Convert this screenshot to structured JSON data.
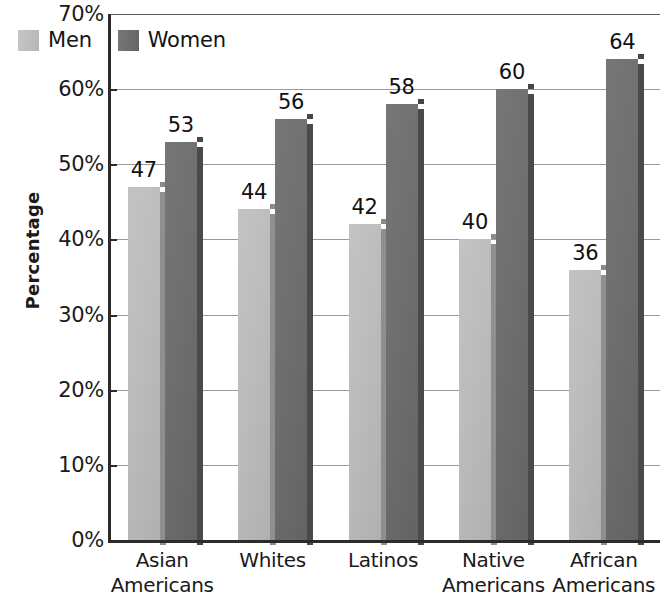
{
  "chart_data": {
    "type": "bar",
    "title": "",
    "subtitle": "",
    "xlabel": "",
    "ylabel": "Percentage",
    "categories": [
      "Asian\nAmericans",
      "Whites",
      "Latinos",
      "Native\nAmericans",
      "African\nAmericans"
    ],
    "series": [
      {
        "name": "Men",
        "values": [
          47,
          44,
          42,
          40,
          36
        ],
        "color": "#b8b8b8"
      },
      {
        "name": "Women",
        "values": [
          53,
          56,
          58,
          60,
          64
        ],
        "color": "#6b6b6b"
      }
    ],
    "ylim": [
      0,
      70
    ],
    "y_ticks": [
      0,
      10,
      20,
      30,
      40,
      50,
      60,
      70
    ],
    "y_tick_labels": [
      "0%",
      "10%",
      "20%",
      "30%",
      "40%",
      "50%",
      "60%",
      "70%"
    ],
    "grid": true,
    "grid_axis": "y",
    "legend_position": "top-left-inside",
    "value_labels": true
  },
  "legend": {
    "items": [
      {
        "label": "Men",
        "swatch": "men"
      },
      {
        "label": "Women",
        "swatch": "women"
      }
    ]
  },
  "axis": {
    "y_title": "Percentage"
  }
}
